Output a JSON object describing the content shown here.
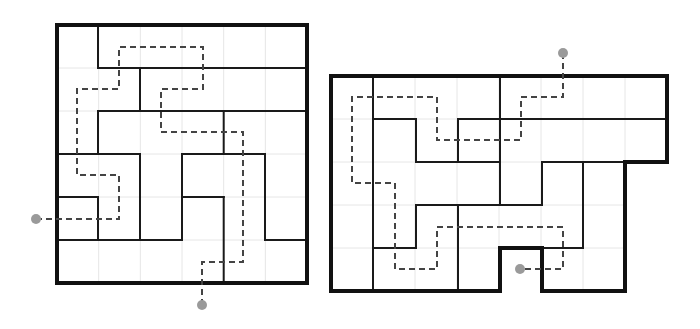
{
  "puzzles": [
    {
      "name": "left-puzzle",
      "grid": {
        "x": 57,
        "y": 25,
        "cols": 6,
        "rows": 6,
        "cell_w": 41.67,
        "cell_h": 43
      },
      "outline": "57,25 307,25 307,283 57,283",
      "walls": [
        [
          98,
          25,
          98,
          68
        ],
        [
          98,
          68,
          307,
          68
        ],
        [
          140,
          68,
          140,
          111
        ],
        [
          98,
          111,
          307,
          111
        ],
        [
          98,
          111,
          98,
          154
        ],
        [
          223.7,
          111,
          223.7,
          154
        ],
        [
          57,
          154,
          140,
          154
        ],
        [
          182,
          154,
          265,
          154
        ],
        [
          140,
          154,
          140,
          240
        ],
        [
          57,
          197,
          98,
          197
        ],
        [
          98,
          197,
          98,
          240
        ],
        [
          57,
          240,
          182,
          240
        ],
        [
          182,
          154,
          182,
          240
        ],
        [
          182,
          197,
          223.7,
          197
        ],
        [
          223.7,
          197,
          223.7,
          283
        ],
        [
          265,
          154,
          265,
          240
        ],
        [
          265,
          240,
          307,
          240
        ]
      ],
      "path": "36,219 119,219 119,175 77,175 77,89 119,89 119,47 203,47 203,89 161,89 161,132 243,132 243,262 202,262 202,305",
      "dots": [
        [
          36,
          219
        ],
        [
          202,
          305
        ]
      ]
    },
    {
      "name": "right-puzzle",
      "grid": {
        "x": 331,
        "y": 76,
        "cols": 8,
        "rows": 5,
        "cell_w": 42,
        "cell_h": 43
      },
      "outline": "331,76 667,76 667,162 625,162 625,291 542,291 542,248 500,248 500,291 331,291",
      "walls": [
        [
          373,
          76,
          373,
          291
        ],
        [
          500,
          76,
          500,
          205
        ],
        [
          373,
          119,
          416,
          119
        ],
        [
          458,
          119,
          667,
          119
        ],
        [
          416,
          119,
          416,
          162
        ],
        [
          458,
          119,
          458,
          162
        ],
        [
          416,
          162,
          500,
          162
        ],
        [
          542,
          162,
          625,
          162
        ],
        [
          542,
          162,
          542,
          205
        ],
        [
          583,
          162,
          583,
          248
        ],
        [
          416,
          205,
          542,
          205
        ],
        [
          416,
          205,
          416,
          248
        ],
        [
          373,
          248,
          416,
          248
        ],
        [
          458,
          205,
          458,
          291
        ],
        [
          542,
          248,
          583,
          248
        ]
      ],
      "path": "563,53 563,97 521,97 521,140 437,140 437,97 352,97 352,183 395,183 395,269 437,269 437,227 563,227 563,269 520,269",
      "dots": [
        [
          563,
          53
        ],
        [
          520,
          269
        ]
      ]
    }
  ]
}
